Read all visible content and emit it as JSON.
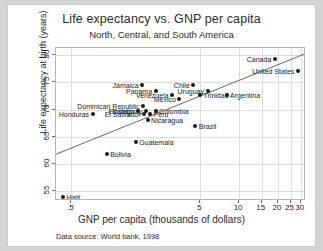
{
  "chart_data": {
    "type": "scatter",
    "title": "Life expectancy vs. GNP per capita",
    "subtitle": "North, Central, and South America",
    "xlabel": "GNP per capita (thousands of dollars)",
    "ylabel": "Life expectancy at birth (years)",
    "note": "Data source:  World bank, 1998",
    "xscale": "log",
    "xlim": [
      0.38,
      33
    ],
    "ylim": [
      53.2,
      81.3
    ],
    "grid": true,
    "legend": "none",
    "xticks": [
      {
        "value": 0.5,
        "label": ".5"
      },
      {
        "value": 5,
        "label": "5"
      },
      {
        "value": 10,
        "label": "10"
      },
      {
        "value": 15,
        "label": "15"
      },
      {
        "value": 20,
        "label": "20"
      },
      {
        "value": 25,
        "label": "25"
      },
      {
        "value": 30,
        "label": "30"
      }
    ],
    "yticks": [
      {
        "value": 55,
        "label": "55"
      },
      {
        "value": 60,
        "label": "60"
      },
      {
        "value": 65,
        "label": "65"
      },
      {
        "value": 70,
        "label": "70"
      },
      {
        "value": 75,
        "label": "75"
      },
      {
        "value": 80,
        "label": "80"
      }
    ],
    "fit_line": {
      "type": "linear-on-log-x",
      "x0": 0.38,
      "y0": 61.8,
      "x1": 33.0,
      "y1": 80.3
    },
    "points": [
      {
        "name": "Haiti",
        "x": 0.43,
        "y": 54.0,
        "label_side": "right"
      },
      {
        "name": "Bolivia",
        "x": 0.94,
        "y": 61.9,
        "label_side": "right"
      },
      {
        "name": "Guatemala",
        "x": 1.58,
        "y": 64.0,
        "label_side": "right"
      },
      {
        "name": "Honduras",
        "x": 0.73,
        "y": 69.1,
        "label_side": "left"
      },
      {
        "name": "Nicaragua",
        "x": 1.95,
        "y": 68.1,
        "label_side": "right"
      },
      {
        "name": "El Salvador",
        "x": 1.83,
        "y": 69.1,
        "label_side": "left"
      },
      {
        "name": "Ecuador",
        "x": 1.65,
        "y": 69.8,
        "label_side": "left"
      },
      {
        "name": "Peru",
        "x": 2.04,
        "y": 69.1,
        "label_side": "right"
      },
      {
        "name": "Paraguay",
        "x": 1.89,
        "y": 69.8,
        "label_side": "left"
      },
      {
        "name": "Colombia",
        "x": 2.25,
        "y": 69.8,
        "label_side": "right"
      },
      {
        "name": "Dominican Republic",
        "x": 1.8,
        "y": 70.7,
        "label_side": "left"
      },
      {
        "name": "Jamaica",
        "x": 1.77,
        "y": 74.6,
        "label_side": "left"
      },
      {
        "name": "Panama",
        "x": 2.25,
        "y": 73.5,
        "label_side": "left"
      },
      {
        "name": "Venezuela",
        "x": 3.02,
        "y": 72.6,
        "label_side": "left"
      },
      {
        "name": "Mexico",
        "x": 3.44,
        "y": 71.9,
        "label_side": "left"
      },
      {
        "name": "Chile",
        "x": 4.41,
        "y": 74.6,
        "label_side": "left"
      },
      {
        "name": "Uruguay",
        "x": 5.68,
        "y": 73.5,
        "label_side": "left"
      },
      {
        "name": "Brazil",
        "x": 4.57,
        "y": 67.0,
        "label_side": "right"
      },
      {
        "name": "Trinidad",
        "x": 4.97,
        "y": 72.6,
        "label_side": "right"
      },
      {
        "name": "Argentina",
        "x": 8.0,
        "y": 72.6,
        "label_side": "right"
      },
      {
        "name": "Canada",
        "x": 18.9,
        "y": 79.3,
        "label_side": "left"
      },
      {
        "name": "United States",
        "x": 28.5,
        "y": 77.0,
        "label_side": "left"
      }
    ]
  }
}
